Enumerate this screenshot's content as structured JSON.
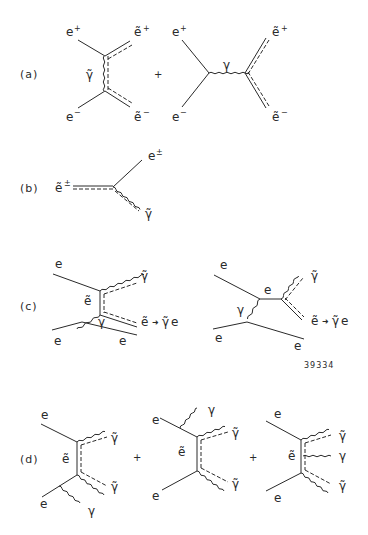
{
  "figure": {
    "id_number": "39334",
    "colors": {
      "ink": "#2a2a2a",
      "background": "#ffffff"
    },
    "panels": [
      {
        "label": "(a)",
        "plus": "+",
        "diagrams": [
          {
            "description": "t-channel photino exchange",
            "in_top": "e+",
            "in_bottom": "e-",
            "out_top": "ẽ+",
            "out_bottom": "ẽ-",
            "exchange": "γ̃"
          },
          {
            "description": "s-channel photon",
            "in_top": "e+",
            "in_bottom": "e-",
            "propagator": "γ",
            "out_top": "ẽ+",
            "out_bottom": "ẽ-"
          }
        ]
      },
      {
        "label": "(b)",
        "diagrams": [
          {
            "description": "selectron decay",
            "in": "ẽ±",
            "out_top": "e±",
            "out_bottom": "γ̃"
          }
        ]
      },
      {
        "label": "(c)",
        "diagrams": [
          {
            "description": "selectron exchange with photon",
            "e_in_top": "e",
            "e_in_bottom": "e",
            "e_out_bottom": "e",
            "internal": "ẽ",
            "photon": "γ",
            "out_top": "γ̃",
            "out_mid": "ẽ",
            "decay": "ẽ → γ̃e",
            "decay_arrow": "→"
          },
          {
            "description": "photon-electron fusion",
            "e_in_top": "e",
            "e_in_bottom": "e",
            "e_out_bottom": "e",
            "internal": "e",
            "photon": "γ",
            "out_top": "γ̃",
            "out_mid": "ẽ",
            "decay": "ẽ → γ̃e",
            "decay_arrow": "→"
          }
        ]
      },
      {
        "label": "(d)",
        "plus": "+",
        "diagrams": [
          {
            "description": "photon from incoming bottom electron",
            "e_top": "e",
            "e_bottom": "e",
            "internal": "ẽ",
            "out_top": "γ̃",
            "out_bottom": "γ̃",
            "photon": "γ"
          },
          {
            "description": "photon from incoming top electron",
            "e_top": "e",
            "e_bottom": "e",
            "internal": "ẽ",
            "out_top": "γ̃",
            "out_bottom": "γ̃",
            "photon": "γ"
          },
          {
            "description": "photon from internal selectron",
            "e_top": "e",
            "e_bottom": "e",
            "internal": "ẽ",
            "out_top": "γ̃",
            "out_mid": "γ",
            "out_bottom": "γ̃"
          }
        ]
      }
    ],
    "text_parts": {
      "e": "e",
      "etilde": "ẽ",
      "gamma": "γ",
      "gtilde": "γ̃",
      "plus_sup": "+",
      "minus_sup": "−",
      "pm_sup": "±",
      "arrow": "➜"
    }
  }
}
